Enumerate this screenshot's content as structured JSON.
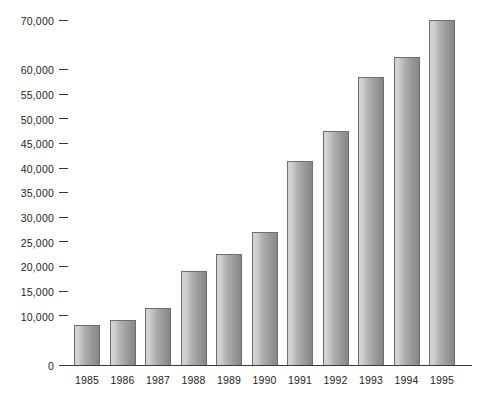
{
  "chart_data": {
    "type": "bar",
    "title": "",
    "subtitle": "",
    "xlabel": "",
    "ylabel": "",
    "legend": [],
    "grid": false,
    "categories": [
      "1985",
      "1986",
      "1987",
      "1988",
      "1989",
      "1990",
      "1991",
      "1992",
      "1993",
      "1994",
      "1995"
    ],
    "values": [
      8200,
      9200,
      11500,
      19000,
      22500,
      27000,
      41500,
      47500,
      58500,
      62500,
      70000
    ],
    "ylim": [
      0,
      72500
    ],
    "ytick_values": [
      0,
      10000,
      15000,
      20000,
      25000,
      30000,
      35000,
      40000,
      45000,
      50000,
      55000,
      60000,
      70000
    ],
    "ytick_labels": [
      "0",
      "10,000",
      "15,000",
      "20,000",
      "25,000",
      "30,000",
      "35,000",
      "40,000",
      "45,000",
      "50,000",
      "55,000",
      "60,000",
      "70,000"
    ],
    "bar_color_light": "#d2d2d2",
    "bar_color_dark": "#868686",
    "bar_outline_color": "#6e6e6e",
    "axis_color": "#3a3a3a",
    "background_color": "#ffffff",
    "text_color": "#231f20"
  }
}
